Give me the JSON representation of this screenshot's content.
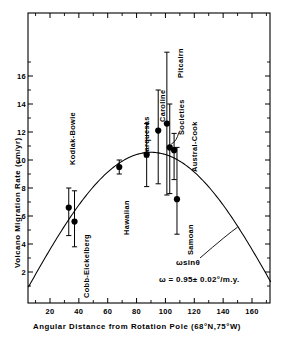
{
  "chart_data": {
    "type": "scatter",
    "title": "",
    "xlabel": "Angular Distance from Rotation Pole (68°N,75°W)",
    "ylabel": "Volcano Migration Rate  (cm/yr)",
    "xlim": [
      0,
      172
    ],
    "ylim": [
      0,
      18.5
    ],
    "xticks": [
      20,
      40,
      60,
      80,
      100,
      120,
      140,
      160
    ],
    "xticklabels": [
      "20",
      "40",
      "60",
      "80",
      "100",
      "120",
      "140",
      "160"
    ],
    "yticks": [
      2,
      4,
      6,
      8,
      10,
      12,
      14,
      16
    ],
    "yticklabels": [
      "2",
      "4",
      "6",
      "8",
      "10",
      "12",
      "14",
      "16"
    ],
    "grid": false,
    "legend": "none",
    "marker": "filled-circle",
    "errorbars": "vertical",
    "points": [
      {
        "name": "Kodiak-Bowie",
        "x": 33,
        "y": 6.6,
        "yerr_low": 4.6,
        "yerr_high": 8.0
      },
      {
        "name": "Cobb-Eickelberg",
        "x": 37,
        "y": 5.6,
        "yerr_low": 3.8,
        "yerr_high": 7.8
      },
      {
        "name": "Hawaiian",
        "x": 68,
        "y": 9.5,
        "yerr_low": 9.0,
        "yerr_high": 10.0
      },
      {
        "name": "Marquesas",
        "x": 87,
        "y": 10.4,
        "yerr_low": 8.1,
        "yerr_high": 12.6
      },
      {
        "name": "Caroline",
        "x": 95,
        "y": 12.1,
        "yerr_low": 8.3,
        "yerr_high": 15.0
      },
      {
        "name": "Pitcairn",
        "x": 101,
        "y": 12.6,
        "yerr_low": 7.5,
        "yerr_high": 17.7
      },
      {
        "name": "Societies",
        "x": 103,
        "y": 10.9,
        "yerr_low": 7.6,
        "yerr_high": 14.0
      },
      {
        "name": "Austral-Cook",
        "x": 106,
        "y": 10.7,
        "yerr_low": 8.6,
        "yerr_high": 11.9
      },
      {
        "name": "Samoan",
        "x": 108,
        "y": 7.2,
        "yerr_low": 4.7,
        "yerr_high": 10.9
      }
    ],
    "curve": {
      "label": "ωsinθ",
      "style": "solid",
      "formula": "omega*sin(theta)",
      "omega_deg_per_my": 0.95,
      "amplitude_cm_per_yr": 10.55
    },
    "annotations": [
      {
        "id": "curve-label",
        "text": "ωsinθ"
      },
      {
        "id": "omega-equation",
        "text": "ω = 0.95± 0.02°/m.y."
      }
    ]
  },
  "labels": {
    "ylabel": "Volcano Migration Rate  (cm/yr)",
    "xlabel": "Angular Distance from Rotation Pole (68°N,75°W)",
    "curve_label": "ωsinθ",
    "equation": "ω = 0.95± 0.02°/m.y."
  },
  "colors": {
    "axis": "#000000",
    "marker": "#000000",
    "curve": "#000000",
    "background": "#ffffff"
  }
}
